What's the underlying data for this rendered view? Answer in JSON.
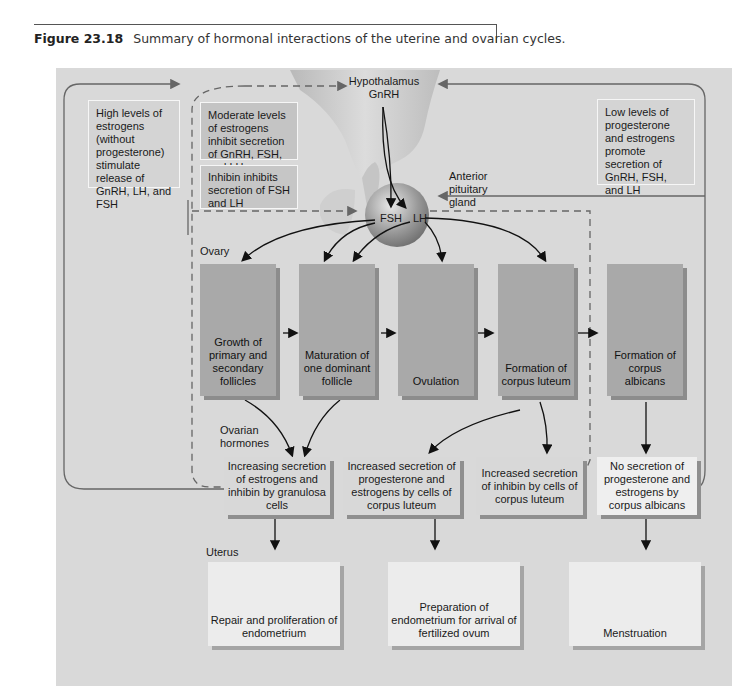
{
  "caption": {
    "figure_number": "Figure 23.18",
    "text": "Summary of hormonal interactions of the uterine and ovarian cycles."
  },
  "brain": {
    "hypothalamus": "Hypothalamus",
    "gnrh": "GnRH",
    "anterior_pituitary": "Anterior pituitary gland",
    "fsh": "FSH",
    "lh": "LH"
  },
  "feedback": {
    "high_estrogen": "High levels of estrogens (without progesterone) stimulate release of GnRH, LH, and FSH",
    "moderate_estrogen": "Moderate levels of estrogens inhibit secretion of GnRH, FSH, and LH",
    "inhibin": "Inhibin inhibits secretion of FSH and LH",
    "low_levels": "Low levels of progesterone and estrogens promote secretion of GnRH, FSH, and LH"
  },
  "labels": {
    "ovary": "Ovary",
    "ovarian_hormones": "Ovarian hormones",
    "uterus": "Uterus"
  },
  "ovary_stages": [
    {
      "label": "Growth of primary and secondary follicles"
    },
    {
      "label": "Maturation of one dominant follicle"
    },
    {
      "label": "Ovulation"
    },
    {
      "label": "Formation of corpus luteum"
    },
    {
      "label": "Formation of corpus albicans"
    }
  ],
  "hormones": [
    {
      "label": "Increasing secretion of estrogens and inhibin by granulosa cells"
    },
    {
      "label": "Increased secretion of progesterone and estrogens by cells of corpus luteum"
    },
    {
      "label": "Increased secretion of inhibin by cells of corpus luteum"
    },
    {
      "label": "No secretion of progesterone and estrogens by corpus albicans"
    }
  ],
  "uterus_stages": [
    {
      "label": "Repair and proliferation of endometrium"
    },
    {
      "label": "Preparation of endometrium for arrival of fertilized ovum"
    },
    {
      "label": "Menstruation"
    }
  ],
  "colors": {
    "panel_bg": "#d9d9d9",
    "stage_box": "#a9a9a9",
    "hormone_box": "#d8d8d8",
    "uterus_box": "#ececec",
    "arrow": "#111111",
    "feedback_line": "#666666"
  }
}
